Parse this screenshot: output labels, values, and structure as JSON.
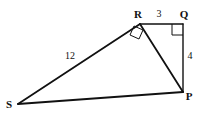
{
  "figure": {
    "background_color": "#ffffff",
    "stroke_color": "#111111",
    "vertices": [
      {
        "name": "R",
        "label": "R",
        "x": 140,
        "y": 24,
        "label_x": 138,
        "label_y": 15
      },
      {
        "name": "Q",
        "label": "Q",
        "x": 183,
        "y": 24,
        "label_x": 184,
        "label_y": 15
      },
      {
        "name": "P",
        "label": "P",
        "x": 183,
        "y": 92,
        "label_x": 189,
        "label_y": 97
      },
      {
        "name": "S",
        "label": "S",
        "x": 18,
        "y": 104,
        "label_x": 9,
        "label_y": 105
      }
    ],
    "edges": [
      {
        "name": "segment-RQ",
        "from": "R",
        "to": "Q",
        "width": 1.4
      },
      {
        "name": "segment-QP",
        "from": "Q",
        "to": "P",
        "width": 1.4
      },
      {
        "name": "segment-RP",
        "from": "R",
        "to": "P",
        "width": 1.8
      },
      {
        "name": "segment-SR",
        "from": "S",
        "to": "R",
        "width": 1.8
      },
      {
        "name": "segment-SP",
        "from": "S",
        "to": "P",
        "width": 1.8
      }
    ],
    "length_labels": [
      {
        "name": "length-RQ",
        "text": "3",
        "x": 159,
        "y": 15
      },
      {
        "name": "length-QP",
        "text": "4",
        "x": 190,
        "y": 57
      },
      {
        "name": "length-SR",
        "text": "12",
        "x": 70,
        "y": 57
      }
    ],
    "right_angles": [
      {
        "name": "right-angle-Q",
        "at": "Q",
        "points": "172,24 172,35 183,35"
      },
      {
        "name": "right-angle-R",
        "at": "R",
        "points": "134,26 130,35 139,39 143,30"
      }
    ]
  }
}
